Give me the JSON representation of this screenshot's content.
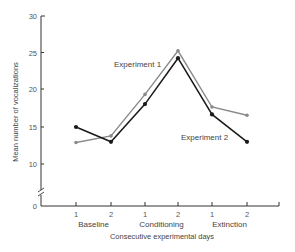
{
  "chart_data": {
    "type": "line",
    "title": "",
    "xlabel": "Consecutive experimental days",
    "ylabel": "Mean number of vocalizations",
    "ylim": [
      0,
      30
    ],
    "y_axis_break": true,
    "yticks": [
      0,
      10,
      15,
      20,
      25,
      30
    ],
    "ytick_labels": [
      "0",
      "10",
      "15",
      "20",
      "25",
      "30"
    ],
    "grid": false,
    "legend_position": "inline labels",
    "x_tick_labels": [
      "1",
      "2",
      "1",
      "2",
      "1",
      "2"
    ],
    "x_groups": [
      {
        "label": "Baseline",
        "days": [
          "1",
          "2"
        ]
      },
      {
        "label": "Conditioning",
        "days": [
          "1",
          "2"
        ]
      },
      {
        "label": "Extinction",
        "days": [
          "1",
          "2"
        ]
      }
    ],
    "categories": [
      "Baseline 1",
      "Baseline 2",
      "Conditioning 1",
      "Conditioning 2",
      "Extinction 1",
      "Extinction 2"
    ],
    "series": [
      {
        "name": "Experiment 1",
        "color": "#8a8a8a",
        "values": [
          12.9,
          13.8,
          19.4,
          25.3,
          17.7,
          16.6
        ]
      },
      {
        "name": "Experiment 2",
        "color": "#1a1a1a",
        "values": [
          15.0,
          13.0,
          18.1,
          24.3,
          16.7,
          13.0
        ]
      }
    ],
    "annotations": [
      {
        "text": "Experiment 1",
        "near": "Conditioning 1",
        "position": "above-left"
      },
      {
        "text": "Experiment 2",
        "near": "Extinction 1",
        "position": "below"
      }
    ]
  },
  "labels": {
    "xlabel": "Consecutive experimental days",
    "ylabel": "Mean number of vocalizations",
    "y0": "0",
    "y10": "10",
    "y15": "15",
    "y20": "20",
    "y25": "25",
    "y30": "30",
    "x1": "1",
    "x2": "2",
    "x3": "1",
    "x4": "2",
    "x5": "1",
    "x6": "2",
    "group1": "Baseline",
    "group2": "Conditioning",
    "group3": "Extinction",
    "series1": "Experiment 1",
    "series2": "Experiment 2"
  }
}
